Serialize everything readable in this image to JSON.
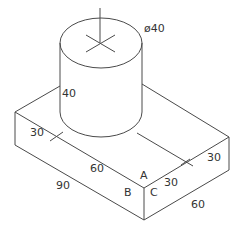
{
  "diagram": {
    "type": "isometric-mechanical-drawing",
    "labels": {
      "diameter": "ø40",
      "cyl_height": "40",
      "left_offset": "30",
      "top_edge_60": "60",
      "front_90": "90",
      "right_30_top": "30",
      "front_30": "30",
      "right_60": "60",
      "point_a": "A",
      "point_b": "B",
      "point_c": "C"
    },
    "colors": {
      "line": "#4a4a4a",
      "text": "#333333"
    }
  }
}
